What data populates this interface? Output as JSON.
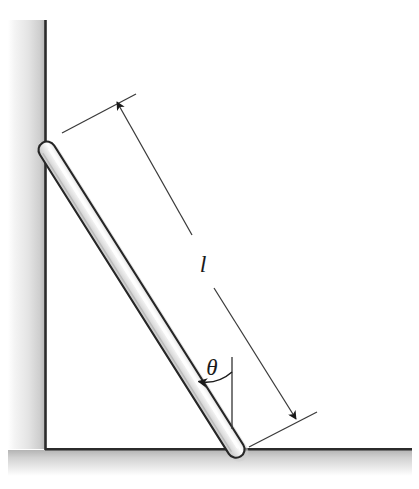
{
  "figure": {
    "background_color": "#ffffff"
  },
  "labels": {
    "length": "l",
    "angle": "θ"
  },
  "colors": {
    "ink": "#1a1a1a",
    "rod_outline": "#262626",
    "rod_fill_light": "#fdfdfd",
    "rod_fill_mid": "#e3e3e3",
    "rod_fill_shadow": "#c9c9c9",
    "wall_shade_dark": "#b9b9b9",
    "wall_shade_light": "#ffffff",
    "floor_shade_dark": "#bcbcbc",
    "dimension_line": "#3a3a3a"
  },
  "geometry": {
    "wall": {
      "edge_x": 45,
      "edge_top_y": 20,
      "edge_bottom_y": 449,
      "shade_left_x": 8,
      "shade_width": 37
    },
    "floor": {
      "edge_y": 449,
      "edge_left_x": 45,
      "edge_right_x": 412,
      "shade_height": 26
    },
    "rod": {
      "top_x": 47,
      "top_y": 150,
      "bottom_x": 236,
      "bottom_y": 449,
      "thickness": 17,
      "angle_from_horizontal_deg": 57.7,
      "cap": "round"
    },
    "dimension_line": {
      "start_x": 117,
      "start_y": 102,
      "end_x": 296,
      "end_y": 419,
      "label_gap_center_x": 203,
      "label_gap_center_y": 264,
      "arrowheads": [
        "start",
        "end"
      ]
    },
    "extension_ticks": [
      {
        "x1": 62,
        "y1": 133,
        "x2": 136,
        "y2": 94
      },
      {
        "x1": 249,
        "y1": 447,
        "x2": 317,
        "y2": 412
      }
    ],
    "angle_marker": {
      "vertex_x": 196,
      "vertex_y": 381,
      "vertical_line_x": 232,
      "vertical_top_y": 357,
      "vertical_bottom_y": 429,
      "arc_radius": 42,
      "label_x": 212,
      "label_y": 372,
      "value_deg": 32.3
    }
  },
  "elements": {
    "wall_name": "vertical wall",
    "floor_name": "horizontal floor",
    "rod_name": "uniform rod",
    "length_dimension_name": "rod length dimension",
    "angle_name": "inclination angle"
  }
}
